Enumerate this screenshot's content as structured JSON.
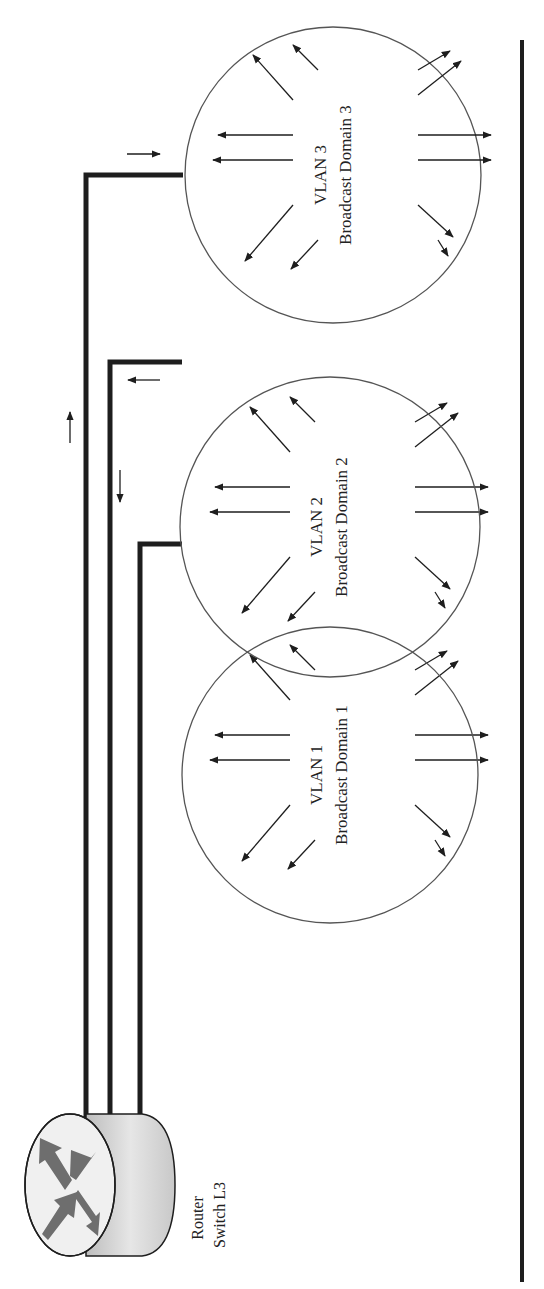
{
  "diagram": {
    "router": {
      "label_line1": "Router",
      "label_line2": "Switch L3",
      "icon": "router-switch-icon"
    },
    "vlans": [
      {
        "id": 1,
        "title": "VLAN 1",
        "subtitle": "Broadcast Domain 1",
        "cx": 330,
        "cy": 775,
        "r": 148,
        "link_y": 777,
        "wire_x": 140,
        "wire_top": 777
      },
      {
        "id": 2,
        "title": "VLAN 2",
        "subtitle": "Broadcast Domain 2",
        "cx": 330,
        "cy": 527,
        "r": 150,
        "link_y": 529,
        "wire_x": 110,
        "wire_top": 529
      },
      {
        "id": 3,
        "title": "VLAN 3",
        "subtitle": "Broadcast Domain 3",
        "cx": 333,
        "cy": 175,
        "r": 148,
        "link_y": 175,
        "wire_x": 86,
        "wire_top": 175
      }
    ],
    "traffic_arrows": [
      {
        "label": "flow-up-outer-wire",
        "direction": "up"
      },
      {
        "label": "flow-down-middle-wire",
        "direction": "down"
      },
      {
        "label": "flow-into-vlan3",
        "direction": "right"
      },
      {
        "label": "flow-out-of-vlan2",
        "direction": "left"
      }
    ],
    "colors": {
      "line": "#1e1e1e",
      "circle": "#555555",
      "router_face": "#f2f2f2",
      "router_side": "#cfcfcf",
      "router_arrows": "#707070"
    }
  }
}
